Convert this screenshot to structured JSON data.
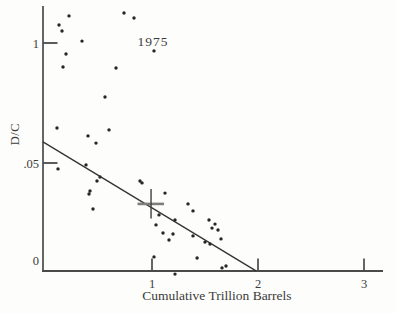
{
  "chart_data": {
    "type": "scatter",
    "title": "",
    "annotation": "1975",
    "x_axis": {
      "title": "Cumulative Trillion Barrels",
      "range": [
        0,
        3.2
      ],
      "ticks": [
        {
          "value": 1,
          "label": "1"
        },
        {
          "value": 2,
          "label": "2"
        },
        {
          "value": 3,
          "label": "3"
        }
      ]
    },
    "y_axis": {
      "title": "D/C",
      "range": [
        0,
        0.11
      ],
      "ticks": [
        {
          "value": 0.1,
          "label": "1",
          "tick_mark": true
        },
        {
          "value": 0.05,
          "label": ".05",
          "tick_mark": true
        },
        {
          "value": 0,
          "label": "0",
          "tick_mark": false
        }
      ]
    },
    "points": [
      [
        0.217,
        0.1113
      ],
      [
        0.736,
        0.1125
      ],
      [
        0.83,
        0.1104
      ],
      [
        0.123,
        0.1075
      ],
      [
        0.151,
        0.105
      ],
      [
        0.34,
        0.1008
      ],
      [
        0.189,
        0.0954
      ],
      [
        1.019,
        0.0967
      ],
      [
        0.16,
        0.09
      ],
      [
        0.66,
        0.0896
      ],
      [
        0.557,
        0.0775
      ],
      [
        0.104,
        0.0646
      ],
      [
        0.594,
        0.0638
      ],
      [
        0.396,
        0.0613
      ],
      [
        0.472,
        0.0583
      ],
      [
        0.113,
        0.0472
      ],
      [
        0.377,
        0.0491
      ],
      [
        0.509,
        0.0434
      ],
      [
        0.481,
        0.0415
      ],
      [
        0.887,
        0.0415
      ],
      [
        0.415,
        0.0368
      ],
      [
        0.406,
        0.0354
      ],
      [
        0.443,
        0.0283
      ],
      [
        0.906,
        0.0406
      ],
      [
        1.123,
        0.0358
      ],
      [
        1.34,
        0.0307
      ],
      [
        1.387,
        0.0274
      ],
      [
        1.066,
        0.0255
      ],
      [
        1.217,
        0.0231
      ],
      [
        1.038,
        0.0208
      ],
      [
        1.104,
        0.017
      ],
      [
        1.198,
        0.0165
      ],
      [
        1.16,
        0.0137
      ],
      [
        1.538,
        0.0231
      ],
      [
        1.594,
        0.0212
      ],
      [
        1.566,
        0.0193
      ],
      [
        1.623,
        0.0184
      ],
      [
        1.651,
        0.0142
      ],
      [
        1.5,
        0.0127
      ],
      [
        1.547,
        0.0118
      ],
      [
        1.387,
        0.0156
      ],
      [
        1.698,
        0.0014
      ],
      [
        1.019,
        0.0057
      ],
      [
        1.425,
        0.0052
      ],
      [
        1.217,
        -0.0024
      ],
      [
        1.66,
        0.0005
      ]
    ],
    "trend_line": {
      "from": [
        -0.028,
        0.0588
      ],
      "to": [
        1.981,
        -0.0009
      ]
    },
    "plus_marker": {
      "x": 0.991,
      "y": 0.0307
    },
    "colors": {
      "point": "#262626",
      "axis": "#4a4a4a",
      "trend_line": "#333333",
      "plus_h": "#7d7d7d",
      "plus_v": "#3f3f3f",
      "text": "#3b3b3b"
    }
  }
}
